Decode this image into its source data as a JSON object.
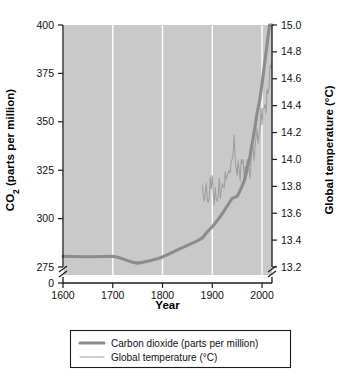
{
  "chart_data": {
    "type": "line",
    "title": "",
    "xlabel": "Year",
    "ylabel": "CO2 (parts per million)",
    "ylabel_right": "Global temperature (°C)",
    "xlim": [
      1600,
      2020
    ],
    "ylim_left": [
      275,
      400
    ],
    "ylim_right": [
      13.2,
      15.0
    ],
    "axis_break_left": true,
    "axis_break_right": true,
    "zero_tick_left": "0",
    "grid": "vertical-white-at-x-ticks",
    "legend_position": "below-plot",
    "xticks": [
      1600,
      1700,
      1800,
      1900,
      2000
    ],
    "xticklabels": [
      "1600",
      "1700",
      "1800",
      "1900",
      "2000"
    ],
    "yticks_left": [
      275,
      300,
      325,
      350,
      375,
      400
    ],
    "yticklabels_left": [
      "275",
      "300",
      "325",
      "350",
      "375",
      "400"
    ],
    "yticks_right": [
      13.2,
      13.4,
      13.6,
      13.8,
      14.0,
      14.2,
      14.4,
      14.6,
      14.8,
      15.0
    ],
    "yticklabels_right": [
      "13.2",
      "13.4",
      "13.6",
      "13.8",
      "14.0",
      "14.2",
      "14.4",
      "14.6",
      "14.8",
      "15.0"
    ],
    "series": [
      {
        "name": "Carbon dioxide (parts per million)",
        "axis": "left",
        "units": "ppm",
        "color": "#8c8c8c",
        "linewidth": "thick",
        "x": [
          1600,
          1620,
          1640,
          1660,
          1680,
          1700,
          1710,
          1720,
          1730,
          1740,
          1750,
          1760,
          1770,
          1780,
          1790,
          1800,
          1810,
          1820,
          1830,
          1840,
          1850,
          1860,
          1870,
          1880,
          1890,
          1900,
          1910,
          1920,
          1930,
          1940,
          1950,
          1955,
          1960,
          1965,
          1970,
          1975,
          1980,
          1985,
          1990,
          1995,
          2000,
          2005,
          2010,
          2015,
          2020
        ],
        "y": [
          280.5,
          280.4,
          280.3,
          280.3,
          280.4,
          280.5,
          280.0,
          279.2,
          278.3,
          277.5,
          277.0,
          277.4,
          278.0,
          278.6,
          279.3,
          280.2,
          281.4,
          282.6,
          283.8,
          285.0,
          286.2,
          287.3,
          288.5,
          290.0,
          293.2,
          295.8,
          299.0,
          302.5,
          306.5,
          310.5,
          311.5,
          314.0,
          316.9,
          320.0,
          325.7,
          331.1,
          338.7,
          346.0,
          354.4,
          360.7,
          369.5,
          379.8,
          389.9,
          400.8,
          412.0
        ]
      },
      {
        "name": "Global temperature (°C)",
        "axis": "right",
        "units": "°C",
        "color": "#9e9e9e",
        "linewidth": "thin",
        "x": [
          1880,
          1882,
          1884,
          1886,
          1888,
          1890,
          1892,
          1894,
          1896,
          1898,
          1900,
          1902,
          1904,
          1906,
          1908,
          1910,
          1912,
          1914,
          1916,
          1918,
          1920,
          1922,
          1924,
          1926,
          1928,
          1930,
          1932,
          1934,
          1936,
          1938,
          1940,
          1942,
          1944,
          1946,
          1948,
          1950,
          1952,
          1954,
          1956,
          1958,
          1960,
          1962,
          1964,
          1966,
          1968,
          1970,
          1972,
          1974,
          1976,
          1978,
          1980,
          1982,
          1984,
          1986,
          1988,
          1990,
          1992,
          1994,
          1996,
          1998,
          2000,
          2002,
          2004,
          2006,
          2008,
          2010,
          2012,
          2014,
          2016,
          2018,
          2020
        ],
        "y": [
          13.81,
          13.73,
          13.69,
          13.76,
          13.82,
          13.7,
          13.68,
          13.72,
          13.87,
          13.78,
          13.88,
          13.74,
          13.66,
          13.79,
          13.7,
          13.69,
          13.74,
          13.86,
          13.71,
          13.76,
          13.82,
          13.8,
          13.79,
          13.91,
          13.85,
          13.88,
          13.9,
          13.92,
          13.9,
          13.99,
          14.0,
          14.05,
          14.18,
          14.0,
          13.93,
          13.88,
          13.99,
          13.92,
          13.84,
          14.0,
          13.97,
          14.0,
          13.85,
          13.95,
          13.91,
          14.0,
          13.96,
          13.92,
          13.86,
          14.01,
          14.12,
          14.08,
          13.99,
          14.1,
          14.17,
          14.23,
          14.12,
          14.18,
          14.22,
          14.38,
          14.26,
          14.38,
          14.38,
          14.41,
          14.34,
          14.52,
          14.49,
          14.53,
          14.7,
          14.68,
          14.72
        ]
      }
    ],
    "legend": [
      {
        "label": "Carbon dioxide (parts per million)",
        "style": "thick-line",
        "color": "#8c8c8c"
      },
      {
        "label": "Global temperature (°C)",
        "style": "thin-line",
        "color": "#9e9e9e"
      }
    ]
  },
  "axes": {
    "left_title_prefix": "CO",
    "left_title_sub": "2",
    "left_title_suffix": " (parts per million)",
    "right_title": "Global temperature (°C)",
    "x_title": "Year"
  },
  "colors": {
    "plot_background": "#c9c9c9",
    "gridline": "#ffffff",
    "co2_line": "#8c8c8c",
    "temperature_line": "#9e9e9e",
    "axis": "#1a1a1a",
    "page_background": "#ffffff"
  }
}
